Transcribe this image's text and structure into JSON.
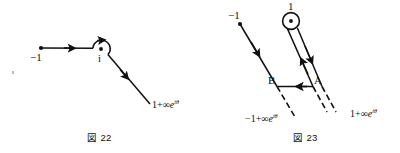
{
  "page": {
    "background_color": "#ffffff",
    "ink_color": "#111111",
    "width": 400,
    "height": 153
  },
  "figures": [
    {
      "id": "fig-22",
      "caption": "図 22",
      "description": "Contour in the complex plane from -1 rightwards to a small circle indented around the point i, then a ray outwards to 1 + infinity e^{i theta}",
      "labels": {
        "left_endpoint": "−1",
        "pole": "i",
        "ray_end_prefix": "1+∞",
        "ray_end_exponent": "iθ"
      },
      "points": {
        "start": [
          41,
          48
        ],
        "loop_center": [
          101,
          49
        ],
        "ray_end": [
          150,
          104
        ]
      },
      "arrows": [
        {
          "name": "horizontal-segment-arrow",
          "at": [
            71,
            48
          ],
          "direction": "right"
        },
        {
          "name": "diagonal-ray-arrow",
          "at": [
            126,
            78
          ],
          "direction": "down-right"
        },
        {
          "name": "loop-top-arrow",
          "at": [
            104,
            33
          ],
          "direction": "right"
        }
      ]
    },
    {
      "id": "fig-23",
      "caption": "図 23",
      "description": "Two parallel rays going down-right; the right pair emerges from a small circle around the point 1; a horizontal arrow from A to B connects them; dashed continuations at the bottom",
      "labels": {
        "left_ray_start": "−1",
        "pole": "1",
        "point_a": "A",
        "point_b": "B",
        "left_ray_end_prefix": "−1+∞",
        "left_ray_end_exponent": "iθ",
        "right_ray_end_prefix": "1+∞",
        "right_ray_end_exponent": "iθ"
      },
      "points": {
        "left_ray_start": [
          240,
          24
        ],
        "loop_center": [
          291,
          21
        ],
        "a": [
          313,
          86
        ],
        "b": [
          277,
          86
        ]
      },
      "arrows": [
        {
          "name": "left-ray-arrow",
          "at": [
            258,
            60
          ],
          "direction": "down-right"
        },
        {
          "name": "inner-right-ray-arrow",
          "at": [
            303,
            46
          ],
          "direction": "up-left"
        },
        {
          "name": "outer-right-ray-arrow",
          "at": [
            314,
            52
          ],
          "direction": "down-right"
        },
        {
          "name": "ab-connector-arrow",
          "at": [
            297,
            86
          ],
          "direction": "left"
        }
      ]
    }
  ]
}
